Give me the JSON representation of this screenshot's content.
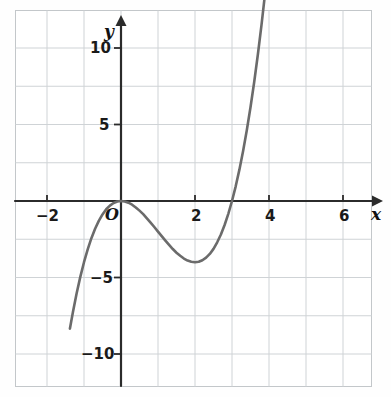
{
  "chart_data": {
    "type": "line",
    "title": "",
    "xlabel": "x",
    "ylabel": "y",
    "equation": "y = x^2(x - 3) = x^3 - 3x^2",
    "xlim": [
      -2.85,
      7.3
    ],
    "ylim": [
      -12.5,
      12.5
    ],
    "grid": true,
    "grid_spacing_x": 1,
    "grid_spacing_y": 2.5,
    "legend": "none",
    "x_ticks": [
      -2,
      2,
      4,
      6
    ],
    "x_tick_labels": [
      "−2",
      "2",
      "4",
      "6"
    ],
    "y_ticks": [
      -10,
      -5,
      5,
      10
    ],
    "y_tick_labels": [
      "−10",
      "−5",
      "5",
      "10"
    ],
    "origin_label": "O",
    "annotations": {
      "x_intercepts": [
        0,
        3
      ],
      "local_maximum": [
        0,
        0
      ],
      "local_minimum": [
        2,
        -4
      ]
    },
    "x": [
      -1.38,
      -1.3,
      -1.2,
      -1.1,
      -1.0,
      -0.9,
      -0.8,
      -0.7,
      -0.6,
      -0.5,
      -0.4,
      -0.3,
      -0.2,
      -0.1,
      0.0,
      0.1,
      0.2,
      0.3,
      0.4,
      0.5,
      0.6,
      0.7,
      0.8,
      0.9,
      1.0,
      1.1,
      1.2,
      1.3,
      1.4,
      1.5,
      1.6,
      1.7,
      1.8,
      1.9,
      2.0,
      2.1,
      2.2,
      2.3,
      2.4,
      2.5,
      2.6,
      2.7,
      2.8,
      2.9,
      3.0,
      3.1,
      3.2,
      3.3,
      3.4,
      3.5,
      3.6,
      3.7,
      3.8,
      3.9,
      4.0,
      4.1
    ],
    "y": [
      -8.34,
      -7.27,
      -6.05,
      -4.96,
      -4.0,
      -3.16,
      -2.43,
      -1.81,
      -1.3,
      -0.88,
      -0.54,
      -0.3,
      -0.13,
      -0.03,
      0.0,
      -0.03,
      -0.11,
      -0.24,
      -0.42,
      -0.63,
      -0.86,
      -1.13,
      -1.41,
      -1.7,
      -2.0,
      -2.3,
      -2.59,
      -2.87,
      -3.14,
      -3.38,
      -3.58,
      -3.76,
      -3.89,
      -3.97,
      -4.0,
      -3.97,
      -3.87,
      -3.7,
      -3.46,
      -3.13,
      -2.7,
      -2.19,
      -1.57,
      -0.84,
      0.0,
      0.96,
      2.05,
      3.27,
      4.62,
      6.13,
      7.78,
      9.59,
      11.56,
      13.7,
      16.0,
      18.48
    ],
    "series": [
      {
        "name": "y = x^3 - 3x^2",
        "color": "#6b6b6b",
        "line_width": 2.6,
        "style": "solid"
      }
    ]
  },
  "axes": {
    "x_axis_label": "x",
    "y_axis_label": "y",
    "origin": "O",
    "axis_color": "#2b2b2b",
    "grid_color": "#cfd3d6",
    "frame_color": "#c3c7ca"
  },
  "ticks": {
    "x": [
      {
        "label": "−2",
        "value": -2
      },
      {
        "label": "2",
        "value": 2
      },
      {
        "label": "4",
        "value": 4
      },
      {
        "label": "6",
        "value": 6
      }
    ],
    "y": [
      {
        "label": "10",
        "value": 10
      },
      {
        "label": "5",
        "value": 5
      },
      {
        "label": "−5",
        "value": -5
      },
      {
        "label": "−10",
        "value": -10
      }
    ]
  }
}
